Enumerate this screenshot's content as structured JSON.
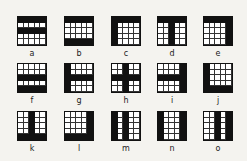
{
  "figure": {
    "grid_size": [
      5,
      5
    ],
    "colors": {
      "fill": "#111111",
      "background": "#f4f3ef",
      "cell": "#ffffff"
    },
    "items": [
      {
        "label": "a",
        "rows": [
          0,
          2
        ],
        "cols": []
      },
      {
        "label": "b",
        "rows": [
          0,
          4
        ],
        "cols": []
      },
      {
        "label": "c",
        "rows": [
          0
        ],
        "cols": [
          0
        ]
      },
      {
        "label": "d",
        "rows": [
          0
        ],
        "cols": [
          2
        ]
      },
      {
        "label": "e",
        "rows": [
          0
        ],
        "cols": [
          4
        ]
      },
      {
        "label": "f",
        "rows": [
          2,
          4
        ],
        "cols": []
      },
      {
        "label": "g",
        "rows": [
          2
        ],
        "cols": [
          0
        ]
      },
      {
        "label": "h",
        "rows": [
          2
        ],
        "cols": [
          2
        ]
      },
      {
        "label": "i",
        "rows": [
          2
        ],
        "cols": [
          4
        ]
      },
      {
        "label": "j",
        "rows": [
          4
        ],
        "cols": [
          0
        ]
      },
      {
        "label": "k",
        "rows": [
          4
        ],
        "cols": [
          2
        ]
      },
      {
        "label": "l",
        "rows": [
          4
        ],
        "cols": [
          4
        ]
      },
      {
        "label": "m",
        "rows": [],
        "cols": [
          0,
          2
        ]
      },
      {
        "label": "n",
        "rows": [],
        "cols": [
          0,
          4
        ]
      },
      {
        "label": "o",
        "rows": [],
        "cols": [
          2,
          4
        ]
      }
    ]
  }
}
